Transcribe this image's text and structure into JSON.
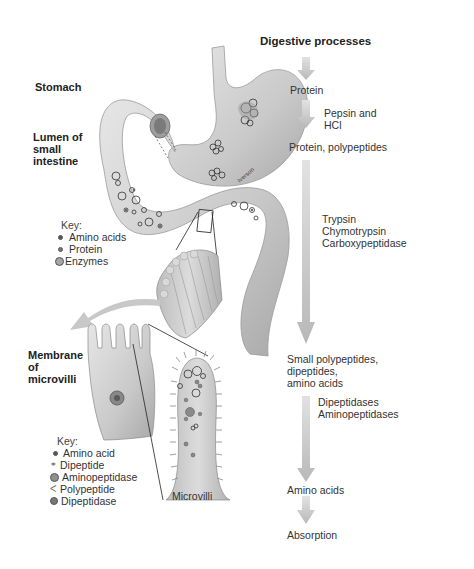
{
  "title": "Digestive processes",
  "anatomy_labels": {
    "stomach": "Stomach",
    "lumen": [
      "Lumen of",
      "small",
      "intestine"
    ],
    "membrane": [
      "Membrane",
      "of",
      "microvilli"
    ],
    "microvilli": "Microvilli",
    "artist_signature": "Iverson"
  },
  "key_lumen": {
    "title": "Key:",
    "items": [
      {
        "label": "Amino acids",
        "icon": "small-dot-icon"
      },
      {
        "label": "Protein",
        "icon": "small-ring-dot-icon"
      },
      {
        "label": "Enzymes",
        "icon": "large-circle-icon"
      }
    ]
  },
  "key_microvilli": {
    "title": "Key:",
    "items": [
      {
        "label": "Amino acid",
        "icon": "small-dot-icon"
      },
      {
        "label": "Dipeptide",
        "icon": "double-ring-icon"
      },
      {
        "label": "Aminopeptidase",
        "icon": "large-circle-icon"
      },
      {
        "label": "Polypeptide",
        "icon": "chain-icon"
      },
      {
        "label": "Dipeptidase",
        "icon": "filled-circle-icon"
      }
    ]
  },
  "flow": {
    "steps": [
      {
        "product": "Protein"
      },
      {
        "product": "Protein, polypeptides",
        "enzymes": [
          "Pepsin and",
          "HCl"
        ]
      },
      {
        "product": "Small polypeptides, dipeptides, amino acids",
        "product_lines": [
          "Small polypeptides,",
          "dipeptides,",
          "amino acids"
        ],
        "enzymes": [
          "Trypsin",
          "Chymotrypsin",
          "Carboxypeptidase"
        ]
      },
      {
        "product": "Amino acids",
        "enzymes": [
          "Dipeptidases",
          "Aminopeptidases"
        ]
      },
      {
        "product": "Absorption"
      }
    ]
  },
  "colors": {
    "arrow": "#c4c4c4",
    "organ": "#cfcfcf",
    "organ_shadow": "#a9a9a9",
    "text": "#2a2a2a"
  }
}
